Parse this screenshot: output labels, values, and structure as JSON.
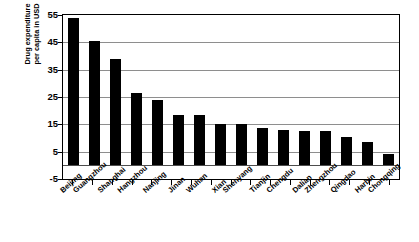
{
  "chart_data": {
    "type": "bar",
    "title": "",
    "xlabel": "",
    "ylabel": "Drug expenditure per capita in USD",
    "ylabel_line1": "Drug expenditure",
    "ylabel_line2": "per capita in USD",
    "ylim": [
      -5,
      55
    ],
    "ytick_labels": [
      "55",
      "45",
      "35",
      "25",
      "15",
      "5",
      "-5"
    ],
    "ytick_values": [
      55,
      45,
      35,
      25,
      15,
      5,
      -5
    ],
    "grid": true,
    "grid_axis": "y",
    "legend": null,
    "bar_color": "#000000",
    "categories": [
      "Beijing",
      "Guangzhou",
      "Shanghai",
      "Hangzhou",
      "Nanjing",
      "Jinan",
      "Wuhan",
      "Xian",
      "Shenyang",
      "Tianjin",
      "Chengdu",
      "Dalian",
      "Zhengzhou",
      "Qingdao",
      "Harbin",
      "Chongqing"
    ],
    "values": [
      54,
      45.5,
      39,
      26.5,
      24,
      18.5,
      18.5,
      15,
      15,
      13.5,
      13,
      12.5,
      12.5,
      10.5,
      8.5,
      4
    ]
  }
}
